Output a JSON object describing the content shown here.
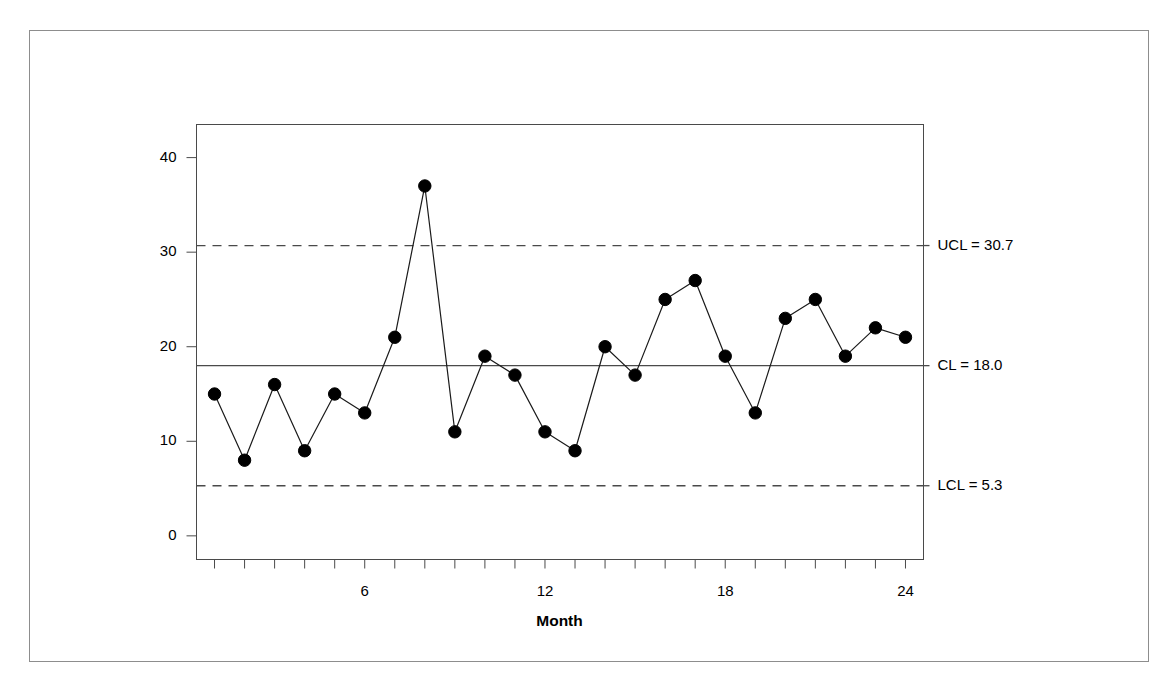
{
  "chart_data": {
    "type": "line",
    "title": "",
    "xlabel": "Month",
    "ylabel": "Number of Anesthesia Narcotics Discrepancies",
    "x": [
      1,
      2,
      3,
      4,
      5,
      6,
      7,
      8,
      9,
      10,
      11,
      12,
      13,
      14,
      15,
      16,
      17,
      18,
      19,
      20,
      21,
      22,
      23,
      24
    ],
    "values": [
      15.0,
      8.0,
      16.0,
      9.0,
      15.0,
      13.0,
      21.0,
      37.0,
      11.0,
      19.0,
      17.0,
      11.0,
      9.0,
      20.0,
      17.0,
      25.0,
      27.0,
      19.0,
      13.0,
      23.0,
      25.0,
      19.0,
      22.0,
      21.0
    ],
    "series": [
      {
        "name": "Number of Anesthesia Narcotics Discrepancies",
        "values": [
          15.0,
          8.0,
          16.0,
          9.0,
          15.0,
          13.0,
          21.0,
          37.0,
          11.0,
          19.0,
          17.0,
          11.0,
          9.0,
          20.0,
          17.0,
          25.0,
          27.0,
          19.0,
          13.0,
          23.0,
          25.0,
          19.0,
          22.0,
          21.0
        ]
      }
    ],
    "xlim": [
      0.4,
      24.6
    ],
    "ylim": [
      -2.5,
      43.5
    ],
    "xticks": [
      1,
      2,
      3,
      4,
      5,
      6,
      7,
      8,
      9,
      10,
      11,
      12,
      13,
      14,
      15,
      16,
      17,
      18,
      19,
      20,
      21,
      22,
      23,
      24
    ],
    "xtick_labels": [
      {
        "value": 6,
        "label": "6"
      },
      {
        "value": 12,
        "label": "12"
      },
      {
        "value": 18,
        "label": "18"
      },
      {
        "value": 24,
        "label": "24"
      }
    ],
    "yticks": [
      0,
      10,
      20,
      30,
      40
    ],
    "ytick_labels": [
      "0",
      "10",
      "20",
      "30",
      "40"
    ],
    "grid": false,
    "legend": "none",
    "marker": "filled-circle",
    "control_limits": [
      {
        "id": "ucl",
        "name": "UCL",
        "value": 30.7,
        "label": "UCL = 30.7",
        "style": "dashed"
      },
      {
        "id": "cl",
        "name": "CL",
        "value": 18.0,
        "label": "CL = 18.0",
        "style": "solid"
      },
      {
        "id": "lcl",
        "name": "LCL",
        "value": 5.3,
        "label": "LCL = 5.3",
        "style": "dashed"
      }
    ],
    "colors": {
      "line": "#1a1a1a",
      "marker": "#000000",
      "limit": "#4a4a4a",
      "axis": "#4a4a4a",
      "background": "#ffffff",
      "frame": "#8d8d8d"
    }
  }
}
